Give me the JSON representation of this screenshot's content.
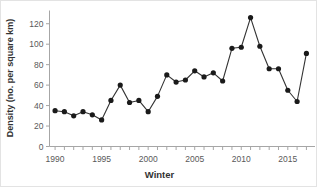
{
  "chart_data": {
    "type": "line",
    "title": "",
    "subtitle": "",
    "xlabel": "Winter",
    "ylabel": "Density (no. per square km)",
    "x": [
      1990,
      1991,
      1992,
      1993,
      1994,
      1995,
      1996,
      1997,
      1998,
      1999,
      2000,
      2001,
      2002,
      2003,
      2004,
      2005,
      2006,
      2007,
      2008,
      2009,
      2010,
      2011,
      2012,
      2013,
      2014,
      2015,
      2016,
      2017
    ],
    "values": [
      35,
      34,
      30,
      34,
      31,
      26,
      45,
      60,
      43,
      45,
      34,
      49,
      70,
      63,
      65,
      74,
      68,
      72,
      64,
      96,
      97,
      126,
      98,
      76,
      76,
      55,
      44,
      91
    ],
    "series": [
      {
        "name": "Density",
        "values": [
          35,
          34,
          30,
          34,
          31,
          26,
          45,
          60,
          43,
          45,
          34,
          49,
          70,
          63,
          65,
          74,
          68,
          72,
          64,
          96,
          97,
          126,
          98,
          76,
          76,
          55,
          44,
          91
        ]
      }
    ],
    "xlim": [
      1989.4,
      2017.6
    ],
    "ylim": [
      0,
      130
    ],
    "x_ticks": [
      1990,
      1995,
      2000,
      2005,
      2010,
      2015
    ],
    "x_tick_labels": [
      "1990",
      "1995",
      "2000",
      "2005",
      "2010",
      "2015"
    ],
    "x_minor_ticks": [
      1990,
      1991,
      1992,
      1993,
      1994,
      1995,
      1996,
      1997,
      1998,
      1999,
      2000,
      2001,
      2002,
      2003,
      2004,
      2005,
      2006,
      2007,
      2008,
      2009,
      2010,
      2011,
      2012,
      2013,
      2014,
      2015,
      2016,
      2017
    ],
    "y_ticks": [
      0,
      20,
      40,
      60,
      80,
      100,
      120
    ],
    "y_tick_labels": [
      "0",
      "20",
      "40",
      "60",
      "80",
      "100",
      "120"
    ],
    "grid": false,
    "legend": false,
    "legend_position": "none",
    "marker": "circle",
    "marker_color": "#1a1a1a",
    "line_color": "#333333",
    "axis_color": "#a6a6a6",
    "background_color": "#ffffff",
    "annotations": []
  }
}
